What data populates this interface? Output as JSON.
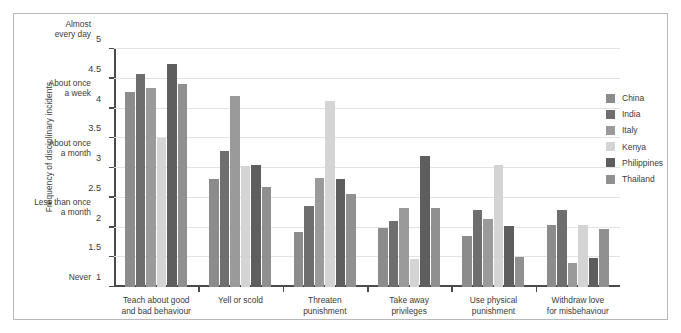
{
  "chart_data": {
    "type": "bar",
    "title": "",
    "subtitle": "",
    "xlabel": "",
    "ylabel": "Frequency of disciplinary incidents",
    "ylim": [
      1,
      5
    ],
    "grid": true,
    "legend_position": "right",
    "categories": [
      "Teach about good\nand bad behaviour",
      "Yell or scold",
      "Threaten\npunishment",
      "Take away\nprivileges",
      "Use physical\npunishment",
      "Withdraw love\nfor misbehaviour"
    ],
    "category_lines": [
      [
        "Teach about good",
        "and bad behaviour"
      ],
      [
        "Yell or scold",
        ""
      ],
      [
        "Threaten",
        "punishment"
      ],
      [
        "Take away",
        "privileges"
      ],
      [
        "Use physical",
        "punishment"
      ],
      [
        "Withdraw love",
        "for misbehaviour"
      ]
    ],
    "ytick_values": [
      1,
      1.5,
      2,
      2.5,
      3,
      3.5,
      4,
      4.5,
      5
    ],
    "ytick_labels": [
      "1",
      "1.5",
      "2",
      "2.5",
      "3",
      "3.5",
      "4",
      "4.5",
      "5"
    ],
    "ydescriptor_labels": [
      {
        "value": 1,
        "lines": [
          "Never",
          ""
        ]
      },
      {
        "value": 2,
        "lines": [
          "Less than once",
          "a month"
        ]
      },
      {
        "value": 3,
        "lines": [
          "About once",
          "a month"
        ]
      },
      {
        "value": 4,
        "lines": [
          "About once",
          "a week"
        ]
      },
      {
        "value": 5,
        "lines": [
          "Almost",
          "every day"
        ]
      }
    ],
    "series": [
      {
        "name": "China",
        "color": "#8c8c8c",
        "values": [
          4.27,
          2.81,
          1.93,
          2.0,
          1.85,
          2.05
        ]
      },
      {
        "name": "India",
        "color": "#6e6e6e",
        "values": [
          4.58,
          3.28,
          2.37,
          2.11,
          2.3,
          2.3
        ]
      },
      {
        "name": "Italy",
        "color": "#9a9a9a",
        "values": [
          4.34,
          4.21,
          2.83,
          2.32,
          2.14,
          1.4
        ]
      },
      {
        "name": "Kenya",
        "color": "#d4d4d4",
        "values": [
          3.51,
          3.04,
          4.13,
          1.47,
          3.05,
          2.05
        ]
      },
      {
        "name": "Philippines",
        "color": "#5e5e5e",
        "values": [
          4.75,
          3.05,
          2.81,
          3.2,
          2.03,
          1.49
        ]
      },
      {
        "name": "Thailand",
        "color": "#909090",
        "values": [
          4.42,
          2.68,
          2.57,
          2.32,
          1.51,
          1.97
        ]
      }
    ]
  }
}
